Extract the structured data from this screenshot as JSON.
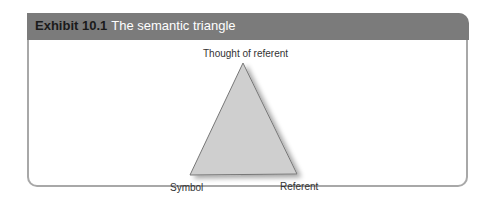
{
  "exhibit": {
    "number": "Exhibit 10.1",
    "title": "The semantic triangle"
  },
  "diagram": {
    "type": "triangle",
    "vertices": {
      "top": {
        "label": "Thought of referent"
      },
      "bottom_left": {
        "label": "Symbol"
      },
      "bottom_right": {
        "label": "Referent"
      }
    },
    "fill_color": "#cfcfcf",
    "stroke_color": "#777777"
  },
  "colors": {
    "header_bg": "#7b7b7b",
    "border": "#a8a8a8"
  }
}
